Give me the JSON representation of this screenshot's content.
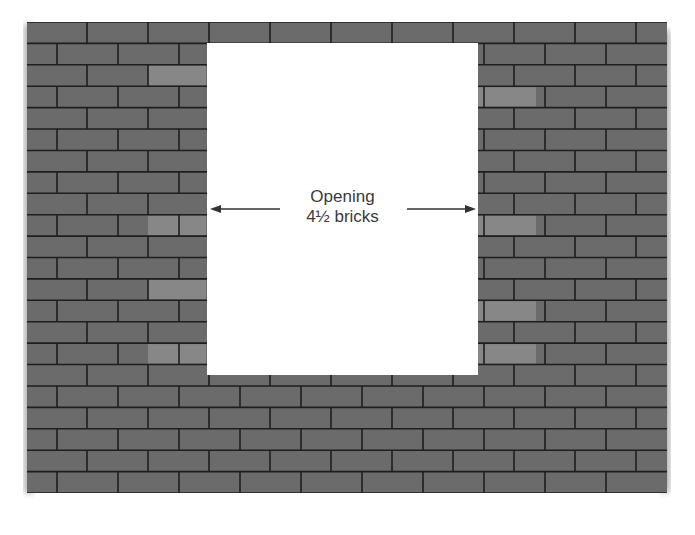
{
  "diagram": {
    "title": "",
    "wall": {
      "left": 27,
      "top": 22,
      "right": 667,
      "bottom": 493,
      "course_height": 21.4,
      "brick_length": 61,
      "courses": 22,
      "brick_color": "#6b6b6b",
      "mortar_color": "#1e1e1e",
      "highlight_color": "#8f8f8f"
    },
    "opening": {
      "left": 207,
      "top": 43,
      "right": 478,
      "bottom": 375,
      "fill": "#ffffff",
      "label_line1": "Opening",
      "label_line2": "4½ bricks",
      "width_in_bricks": "4½"
    },
    "arrows": {
      "left_arrow": {
        "x1": 280,
        "x2": 210,
        "y": 209
      },
      "right_arrow": {
        "x1": 407,
        "x2": 476,
        "y": 209
      },
      "color": "#333333"
    }
  }
}
